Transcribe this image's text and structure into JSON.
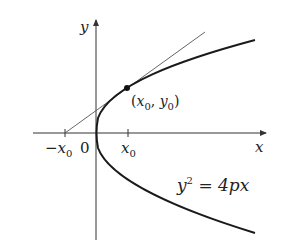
{
  "diagram": {
    "axes": {
      "x_label": "x",
      "y_label": "y"
    },
    "ticks": {
      "neg_x0_minus": "−",
      "neg_x0_var": "x",
      "neg_x0_sub": "0",
      "origin": "0",
      "x0_var": "x",
      "x0_sub": "0"
    },
    "point": {
      "open": "(",
      "x": "x",
      "x_sub": "0",
      "sep": ", ",
      "y": "y",
      "y_sub": "0",
      "close": ")"
    },
    "equation": {
      "lhs": "y",
      "exp": "2",
      "rhs": " = 4px"
    },
    "colors": {
      "curve": "#1a1a1a",
      "axis": "#333333",
      "tangent": "#555555"
    }
  }
}
